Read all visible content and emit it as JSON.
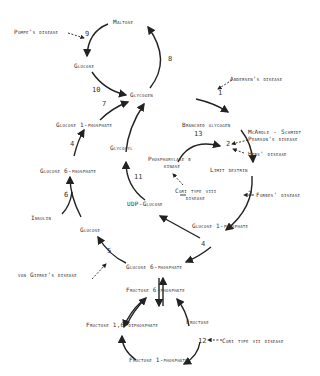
{
  "metabolites": {
    "maltose": "Maltose",
    "glucose_top": "Glucose",
    "glycogen": "Glycogen",
    "branched_glycogen": "Branched glycogen",
    "limit_dextrin": "Limit dextrin",
    "glucose_1p_left": "Glucose 1-phosphate",
    "glucose_6p_left": "Glucose 6-phosphate",
    "insulin": "Insulin",
    "glucose_mid": "Glucose",
    "glycosyl": "Glycosyl",
    "udp_glucose": "UDP-Glucose",
    "phosphorylase_kinase_line1": "Phosphorylase b",
    "phosphorylase_kinase_line2": "kinase",
    "glucose_1p_right": "Glucose 1-phosphate",
    "glucose_6p_center": "Glucose 6-phosphate",
    "fructose_6p": "Fructose 6-phosphate",
    "fructose_16dp": "Fructose 1,6-diphosphate",
    "fructose": "Fructose",
    "fructose_1p": "Fructose 1-phosphate"
  },
  "diseases": {
    "pompe": "Pompe's disease",
    "andersen": "Andersen's disease",
    "mcardle_line1": "McArdle - Schmidt",
    "mcardle_line2": "Pearson's disease",
    "hers": "Hers' disease",
    "cori_viii_line1": "Cori type viii",
    "cori_viii_line2": "disease",
    "forbes": "Forbes' disease",
    "von_gierke": "von Gierke's disease",
    "cori_vii": "Cori type vii disease"
  },
  "steps": {
    "s1": "1",
    "s2": "2",
    "s3": "3",
    "s4a": "4",
    "s4b": "4",
    "s5": "5",
    "s6": "6",
    "s7": "7",
    "s8": "8",
    "s9": "9",
    "s10": "10",
    "s11": "11",
    "s12": "12",
    "s13": "13"
  }
}
